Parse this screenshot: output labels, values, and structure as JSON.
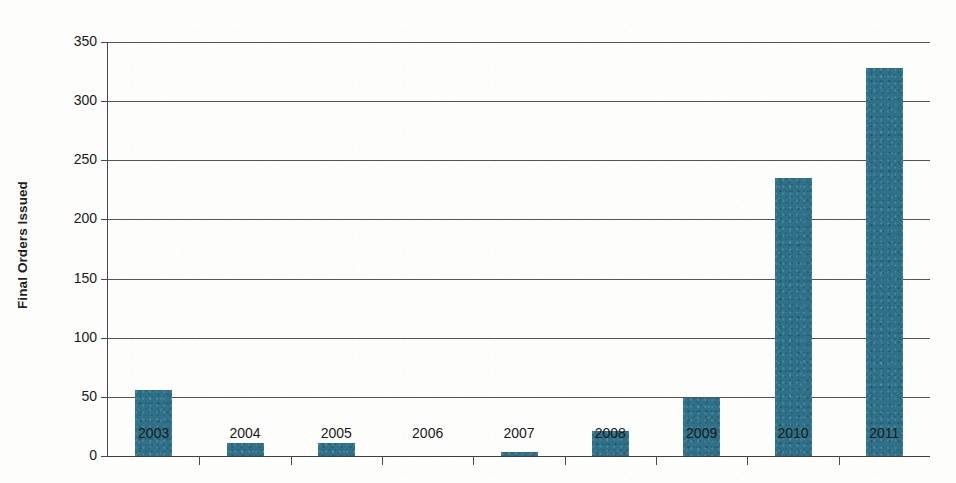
{
  "chart_data": {
    "type": "bar",
    "title": "",
    "xlabel": "",
    "ylabel": "Final Orders Issued",
    "categories": [
      "2003",
      "2004",
      "2005",
      "2006",
      "2007",
      "2008",
      "2009",
      "2010",
      "2011"
    ],
    "values": [
      56,
      11,
      11,
      0,
      3,
      21,
      49,
      235,
      328
    ],
    "series": [
      {
        "name": "Final Orders Issued",
        "values": [
          56,
          11,
          11,
          0,
          3,
          21,
          49,
          235,
          328
        ]
      }
    ],
    "ylim": [
      0,
      350
    ],
    "y_ticks": [
      0,
      50,
      100,
      150,
      200,
      250,
      300,
      350
    ],
    "y_tick_labels": [
      "0",
      "50",
      "100",
      "150",
      "200",
      "250",
      "300",
      "350"
    ],
    "grid": "horizontal",
    "legend": "none",
    "bar_color": "#2e7189",
    "axis_color": "#4a4a4a",
    "gridline_color": "#555555",
    "background_color": "#fdfdfc"
  }
}
